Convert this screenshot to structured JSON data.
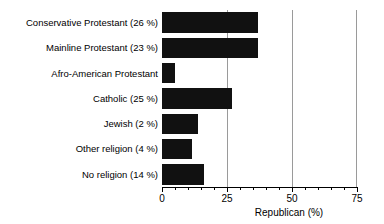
{
  "chart_data": {
    "type": "bar",
    "orientation": "horizontal",
    "title": "",
    "xlabel": "Republican (%)",
    "ylabel": "",
    "xlim": [
      0,
      75
    ],
    "xticks": [
      0,
      25,
      50,
      75
    ],
    "xtick_labels": [
      "0",
      "25",
      "50",
      "75"
    ],
    "minor_tick_step": 5,
    "grid": true,
    "gridlines_at": [
      25,
      50,
      75
    ],
    "legend": null,
    "bar_color": "#111111",
    "categories": [
      "Conservative Protestant (26 %)",
      "Mainline Protestant (23 %)",
      "Afro-American Protestant",
      "Catholic (25 %)",
      "Jewish (2 %)",
      "Other religion (4 %)",
      "No religion (14 %)"
    ],
    "values": [
      37,
      37,
      5,
      27,
      14,
      11.5,
      16
    ],
    "group_shares": [
      "26 %",
      "23 %",
      "",
      "25 %",
      "2 %",
      "4 %",
      "14 %"
    ]
  },
  "axis": {
    "x_title": "Republican (%)",
    "tick_0": "0",
    "tick_25": "25",
    "tick_50": "50",
    "tick_75": "75"
  },
  "rows": [
    {
      "label": "Conservative Protestant (26 %)",
      "value": 37
    },
    {
      "label": "Mainline Protestant (23 %)",
      "value": 37
    },
    {
      "label": "Afro-American Protestant",
      "value": 5
    },
    {
      "label": "Catholic (25 %)",
      "value": 27
    },
    {
      "label": "Jewish (2 %)",
      "value": 14
    },
    {
      "label": "Other religion (4 %)",
      "value": 11.5
    },
    {
      "label": "No religion (14 %)",
      "value": 16
    }
  ]
}
